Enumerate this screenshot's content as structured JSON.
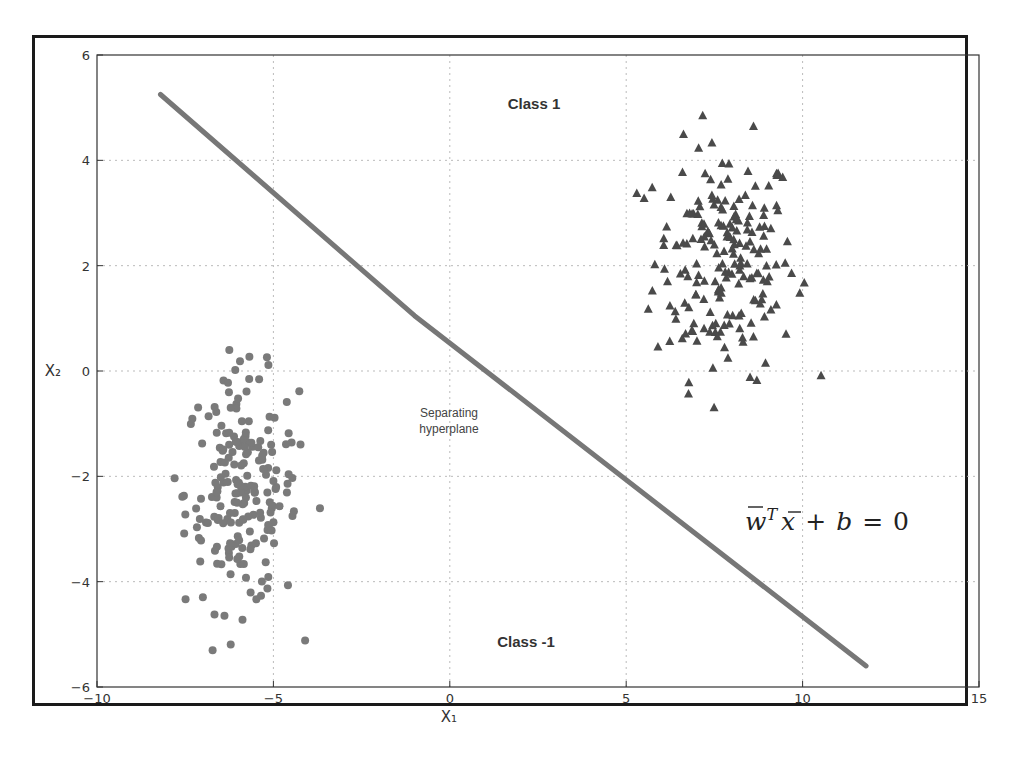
{
  "chart_data": {
    "type": "scatter",
    "title": "",
    "xlabel": "X₁",
    "ylabel": "X₂",
    "xlim": [
      -10,
      15
    ],
    "ylim": [
      -6,
      6
    ],
    "xticks": [
      -10,
      -5,
      0,
      5,
      10,
      15
    ],
    "yticks": [
      -6,
      -4,
      -2,
      0,
      2,
      4,
      6
    ],
    "xtick_labels": [
      "−10",
      "−5",
      "0",
      "5",
      "10",
      "15"
    ],
    "ytick_labels": [
      "−6",
      "−4",
      "−2",
      "0",
      "2",
      "4",
      "6"
    ],
    "grid": true,
    "series": [
      {
        "name": "Class 1",
        "marker": "triangle",
        "color": "#4a4a4a",
        "center": [
          7.8,
          2.1
        ],
        "std": [
          1.0,
          1.1
        ],
        "count": 200,
        "extent_x": [
          5.3,
          10.8
        ],
        "extent_y": [
          -0.7,
          5.2
        ]
      },
      {
        "name": "Class -1",
        "marker": "circle",
        "color": "#7a7a7a",
        "center": [
          -5.9,
          -2.3
        ],
        "std": [
          0.8,
          1.1
        ],
        "count": 200,
        "extent_x": [
          -7.8,
          -3.3
        ],
        "extent_y": [
          -5.3,
          0.4
        ]
      }
    ],
    "lines": [
      {
        "name": "Separating hyperplane",
        "x": [
          -8.2,
          -1.0,
          11.8
        ],
        "y": [
          5.25,
          1.05,
          -5.6
        ],
        "color": "#777777"
      }
    ],
    "annotations": [
      {
        "text": "Class 1",
        "x": 2.3,
        "y": 5.0
      },
      {
        "text": "Class -1",
        "x": 2.3,
        "y": -5.0
      },
      {
        "text": "Separating hyperplane",
        "x": 0,
        "y": -1.3
      },
      {
        "text": "w̄ᵀx̄ + b = 0",
        "x": 12,
        "y": -3.0
      }
    ]
  },
  "labels": {
    "class_pos": "Class 1",
    "class_neg": "Class -1",
    "hyperplane_line1": "Separating",
    "hyperplane_line2": "hyperplane",
    "equation": "w̄ᵀx̄ + b = 0",
    "xlabel": "X₁",
    "ylabel": "X₂"
  }
}
